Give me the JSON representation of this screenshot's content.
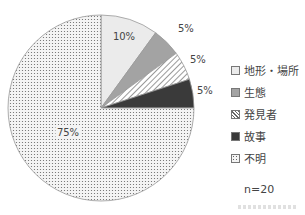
{
  "chart_data": {
    "type": "pie",
    "title": "",
    "categories": [
      "地形・場所",
      "生態",
      "発見者",
      "故事",
      "不明"
    ],
    "values": [
      10,
      5,
      5,
      5,
      75
    ],
    "labels": [
      "10%",
      "5%",
      "5%",
      "5%",
      "75%"
    ],
    "fills": [
      "light-gray",
      "medium-gray",
      "diagonal-hatch",
      "dark-gray",
      "dotted"
    ],
    "colors": [
      "#ebebeb",
      "#a3a3a3",
      "#ffffff",
      "#3a3a3a",
      "#f2f2f2"
    ],
    "start_angle": "12 o'clock",
    "direction": "clockwise",
    "legend_position": "right",
    "n": "n=20"
  },
  "legend": {
    "items": [
      {
        "label": "地形・場所"
      },
      {
        "label": "生態"
      },
      {
        "label": "発見者"
      },
      {
        "label": "故事"
      },
      {
        "label": "不明"
      }
    ]
  },
  "footer": {
    "n_label": "n=20"
  }
}
